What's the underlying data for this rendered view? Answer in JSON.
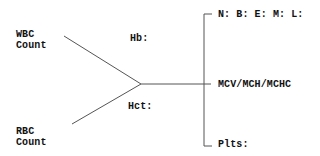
{
  "diagram": {
    "type": "lab-fishbone",
    "line_color": "#555555",
    "labels": {
      "wbc_line1": "WBC",
      "wbc_line2": "Count",
      "rbc_line1": "RBC",
      "rbc_line2": "Count",
      "hb": "Hb:",
      "hct": "Hct:",
      "differential": "N: B: E: M: L:",
      "indices": "MCV/MCH/MCHC",
      "plts": "Plts:"
    }
  }
}
